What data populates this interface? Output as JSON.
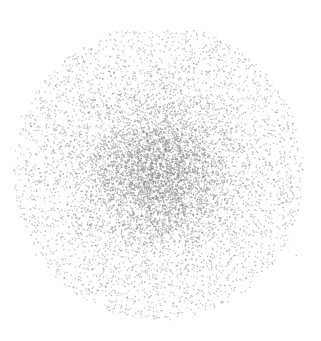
{
  "chart_data": {
    "type": "scatter",
    "title": "",
    "xlabel": "",
    "ylabel": "",
    "grid": false,
    "axes_visible": false,
    "legend": null,
    "distribution": "2D Gaussian-like point cloud",
    "center_px": [
      158,
      172
    ],
    "core_sigma_px": 38,
    "halo_radius_px": 145,
    "x_extent_px": [
      15,
      300
    ],
    "y_extent_px": [
      35,
      330
    ],
    "approx_point_count": 9000,
    "point_color": "#8a8a8a",
    "point_size_px": 1.3
  },
  "colors": {
    "background": "#ffffff",
    "points": "#8a8a8a"
  }
}
